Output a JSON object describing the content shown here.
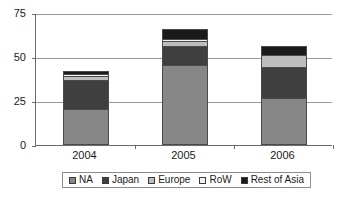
{
  "chart_data": {
    "type": "bar",
    "stacked": true,
    "title": "",
    "xlabel": "",
    "ylabel": "",
    "categories": [
      "2004",
      "2005",
      "2006"
    ],
    "ylim": [
      0,
      75
    ],
    "yticks": [
      0,
      25,
      50,
      75
    ],
    "ytick_labels": [
      "0",
      "25",
      "50",
      "75"
    ],
    "grid": true,
    "grid_axis": "y",
    "legend_position": "bottom",
    "series": [
      {
        "name": "NA",
        "color": "#878787",
        "values": [
          20,
          45,
          26
        ]
      },
      {
        "name": "Japan",
        "color": "#3f3f3f",
        "values": [
          17,
          11,
          18
        ]
      },
      {
        "name": "Europe",
        "color": "#bdbdbd",
        "values": [
          2,
          3,
          7
        ]
      },
      {
        "name": "RoW",
        "color": "#f2f2f2",
        "values": [
          1.5,
          1,
          0
        ]
      },
      {
        "name": "Rest of Asia",
        "color": "#1a1a1a",
        "values": [
          1.5,
          6,
          5
        ]
      }
    ],
    "totals": [
      42,
      66,
      56
    ]
  },
  "axis": {
    "frame_color": "#6b6b6b",
    "grid_color": "#9a9a9a"
  },
  "legend": {
    "border_color": "#8c8c8c",
    "entries": [
      {
        "label": "NA",
        "color": "#878787"
      },
      {
        "label": "Japan",
        "color": "#3f3f3f"
      },
      {
        "label": "Europe",
        "color": "#bdbdbd"
      },
      {
        "label": "RoW",
        "color": "#f2f2f2"
      },
      {
        "label": "Rest of Asia",
        "color": "#1a1a1a"
      }
    ]
  }
}
